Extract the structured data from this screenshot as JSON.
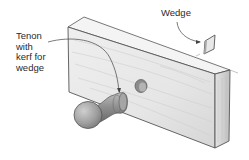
{
  "labels": {
    "tenon": [
      "Tenon",
      "with",
      "kerf for",
      "wedge"
    ],
    "wedge": "Wedge"
  },
  "colors": {
    "outline": "#555555",
    "wood_light": "#ececec",
    "wood_mid": "#d9d9d9",
    "wood_dark": "#bdbdbd",
    "knob": "#9a9a9a",
    "text": "#2a2a2a"
  },
  "parts": [
    "board",
    "through-hole",
    "knob-with-tenon",
    "wedge"
  ]
}
